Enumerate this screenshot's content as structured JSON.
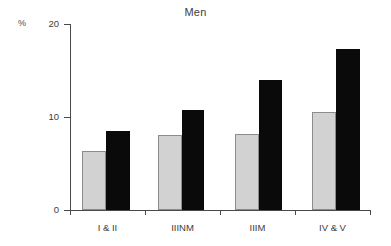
{
  "chart_data": {
    "type": "bar",
    "title": "Men",
    "xlabel": "",
    "ylabel": "%",
    "ylim": [
      0,
      20
    ],
    "yticks": [
      0,
      10,
      20
    ],
    "ytick_labels": [
      "0",
      "10",
      "20"
    ],
    "grid": false,
    "legend": "none",
    "categories": [
      "I & II",
      "IIINM",
      "IIIM",
      "IV & V"
    ],
    "series": [
      {
        "name": "light-gray-series",
        "color": "#d2d2d2",
        "values": [
          6.3,
          8.1,
          8.2,
          10.5
        ]
      },
      {
        "name": "black-series",
        "color": "#0a0a0a",
        "values": [
          8.5,
          10.8,
          14.0,
          17.3
        ]
      }
    ]
  },
  "axis": {
    "unit_label": "%",
    "tick_0": "0",
    "tick_10": "10",
    "tick_20": "20"
  },
  "categories": {
    "c0": "I & II",
    "c1": "IIINM",
    "c2": "IIIM",
    "c3": "IV & V"
  }
}
